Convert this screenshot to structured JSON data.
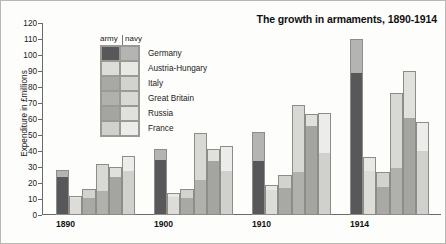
{
  "chart_data": {
    "type": "bar",
    "title": "The growth in armaments, 1890-1914",
    "xlabel": "",
    "ylabel": "Expenditure in £millions",
    "ylim": [
      0,
      120
    ],
    "ytick_step": 10,
    "yticks": [
      0,
      10,
      20,
      30,
      40,
      50,
      60,
      70,
      80,
      90,
      100,
      110,
      120
    ],
    "grid": false,
    "stacked": true,
    "legend_position": "top-left inside plot",
    "legend_column_headers": [
      "army",
      "navy"
    ],
    "categories": [
      "1890",
      "1900",
      "1910",
      "1914"
    ],
    "countries": [
      "Germany",
      "Austria-Hungary",
      "Italy",
      "Great Britain",
      "Russia",
      "France"
    ],
    "colors": {
      "Germany": {
        "army": "#58585a",
        "navy": "#b4b4b2"
      },
      "Austria-Hungary": {
        "army": "#dcdcd8",
        "navy": "#e8e8e4"
      },
      "Italy": {
        "army": "#a8a8a4",
        "navy": "#d2d2ce"
      },
      "Great Britain": {
        "army": "#b0b0ac",
        "navy": "#d8d8d4"
      },
      "Russia": {
        "army": "#a4a4a0",
        "navy": "#e0e0dc"
      },
      "France": {
        "army": "#d0d0cc",
        "navy": "#ececea"
      }
    },
    "series": [
      {
        "name": "1890",
        "bars": [
          {
            "country": "Germany",
            "army": 24,
            "navy": 4,
            "total": 28
          },
          {
            "country": "Austria-Hungary",
            "army": 11,
            "navy": 1,
            "total": 12
          },
          {
            "country": "Italy",
            "army": 11,
            "navy": 5,
            "total": 16
          },
          {
            "country": "Great Britain",
            "army": 15,
            "navy": 17,
            "total": 32
          },
          {
            "country": "Russia",
            "army": 24,
            "navy": 6,
            "total": 30
          },
          {
            "country": "France",
            "army": 28,
            "navy": 9,
            "total": 37
          }
        ]
      },
      {
        "name": "1900",
        "bars": [
          {
            "country": "Germany",
            "army": 35,
            "navy": 6,
            "total": 41
          },
          {
            "country": "Austria-Hungary",
            "army": 12,
            "navy": 2,
            "total": 14
          },
          {
            "country": "Italy",
            "army": 11,
            "navy": 5,
            "total": 16
          },
          {
            "country": "Great Britain",
            "army": 22,
            "navy": 29,
            "total": 51
          },
          {
            "country": "Russia",
            "army": 34,
            "navy": 7,
            "total": 41
          },
          {
            "country": "France",
            "army": 28,
            "navy": 15,
            "total": 43
          }
        ]
      },
      {
        "name": "1910",
        "bars": [
          {
            "country": "Germany",
            "army": 34,
            "navy": 18,
            "total": 52
          },
          {
            "country": "Austria-Hungary",
            "army": 16,
            "navy": 3,
            "total": 19
          },
          {
            "country": "Italy",
            "army": 17,
            "navy": 8,
            "total": 25
          },
          {
            "country": "Great Britain",
            "army": 27,
            "navy": 42,
            "total": 69
          },
          {
            "country": "Russia",
            "army": 56,
            "navy": 7,
            "total": 63
          },
          {
            "country": "France",
            "army": 39,
            "navy": 25,
            "total": 64
          }
        ]
      },
      {
        "name": "1914",
        "bars": [
          {
            "country": "Germany",
            "army": 89,
            "navy": 21,
            "total": 110
          },
          {
            "country": "Austria-Hungary",
            "army": 28,
            "navy": 8,
            "total": 36
          },
          {
            "country": "Italy",
            "army": 18,
            "navy": 9,
            "total": 27
          },
          {
            "country": "Great Britain",
            "army": 29,
            "navy": 47,
            "total": 76
          },
          {
            "country": "Russia",
            "army": 61,
            "navy": 29,
            "total": 90
          },
          {
            "country": "France",
            "army": 40,
            "navy": 18,
            "total": 58
          }
        ]
      }
    ]
  }
}
